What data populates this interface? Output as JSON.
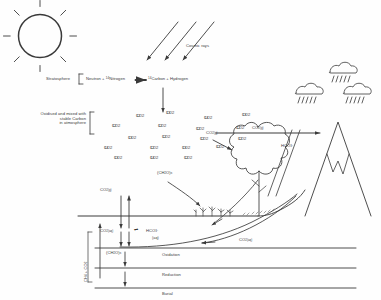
{
  "diagram": {
    "type": "schematic",
    "background": "#fefefe",
    "ink": "#3a3a3a"
  },
  "sun": {
    "name": "sun",
    "rays": 8
  },
  "cosmic": {
    "label": "Cosmic rays",
    "ray_count": 3
  },
  "stratosphere": {
    "label": "Stratosphere",
    "reaction_left": "Neutron",
    "plus1": "+",
    "reactant2_pre": "14",
    "reactant2": "Nitrogen",
    "arrow": "⟶",
    "product1_pre": "14",
    "product1": "Carbon",
    "plus2": "+",
    "product2": "Hydrogen"
  },
  "atmosphere": {
    "note_line1": "Oxidised and mixed with",
    "note_line2": "stable Carbon",
    "note_line3": "in atmosphere",
    "co2_labels": [
      {
        "pre": "12",
        "t": "CO",
        "sub": "2",
        "x": 36,
        "y": 3
      },
      {
        "pre": "13",
        "t": "CO",
        "sub": "2",
        "x": 66,
        "y": 0
      },
      {
        "pre": "14",
        "t": "CO",
        "sub": "2",
        "x": 104,
        "y": 5
      },
      {
        "pre": "13",
        "t": "CO",
        "sub": "2",
        "x": 142,
        "y": 2
      },
      {
        "pre": "12",
        "t": "CO",
        "sub": "2",
        "x": 12,
        "y": 13
      },
      {
        "pre": "12",
        "t": "CO",
        "sub": "2",
        "x": 58,
        "y": 13
      },
      {
        "pre": "12",
        "t": "CO",
        "sub": "2",
        "x": 96,
        "y": 16
      },
      {
        "pre": "12",
        "t": "CO",
        "sub": "2",
        "x": 136,
        "y": 15
      },
      {
        "pre": "13",
        "t": "CO",
        "sub": "2",
        "x": 28,
        "y": 25
      },
      {
        "pre": "12",
        "t": "CO",
        "sub": "2",
        "x": 62,
        "y": 24
      },
      {
        "pre": "12",
        "t": "CO",
        "sub": "2",
        "x": 100,
        "y": 26
      },
      {
        "pre": "12",
        "t": "CO",
        "sub": "2",
        "x": 138,
        "y": 26
      },
      {
        "pre": "14",
        "t": "CO",
        "sub": "2",
        "x": 4,
        "y": 35
      },
      {
        "pre": "12",
        "t": "CO",
        "sub": "2",
        "x": 50,
        "y": 35
      },
      {
        "pre": "13",
        "t": "CO",
        "sub": "2",
        "x": 82,
        "y": 35
      },
      {
        "pre": "12",
        "t": "CO",
        "sub": "2",
        "x": 116,
        "y": 34
      },
      {
        "pre": "13",
        "t": "CO",
        "sub": "2",
        "x": 14,
        "y": 45
      },
      {
        "pre": "14",
        "t": "CO",
        "sub": "2",
        "x": 50,
        "y": 45
      },
      {
        "pre": "12",
        "t": "CO",
        "sub": "2",
        "x": 84,
        "y": 45
      }
    ]
  },
  "fluxes": {
    "co2_gas_long": {
      "t": "CO",
      "sub": "2(g)"
    },
    "co2_gas_tree": {
      "t": "CO",
      "sub": "2(g)"
    },
    "co2_gas_sea": {
      "t": "CO",
      "sub": "2(g)"
    },
    "co2_aq_sea": {
      "t": "CO",
      "sub": "2(aq)"
    },
    "co2_aq_return": {
      "t": "CO",
      "sub": "2(aq)"
    },
    "hco3_mountain": {
      "t": "HCO",
      "sub": "3",
      "sup": "-"
    },
    "hco3_sea": {
      "t": "HCO",
      "sub": "3",
      "suffix": "(aq)",
      "sup": "-"
    },
    "equilibrium": "⇌",
    "organic_tree": {
      "t": "(CH",
      "sub": "2",
      "t2": "O)",
      "sub2": "s"
    },
    "organic_sed": {
      "t": "(CH",
      "sub": "2",
      "t2": "O)",
      "sub2": "s"
    },
    "methane_co2": {
      "t": "CH",
      "sub": "4",
      "plus": " + CO",
      "sub2": "2"
    }
  },
  "layers": [
    {
      "label": "Oxidation"
    },
    {
      "label": "Reduction"
    },
    {
      "label": "Burial"
    }
  ],
  "scene": {
    "tree_name": "deciduous-tree",
    "mountain_name": "mountain-with-snowcap",
    "clouds": 3,
    "sea_name": "sea-surface"
  }
}
